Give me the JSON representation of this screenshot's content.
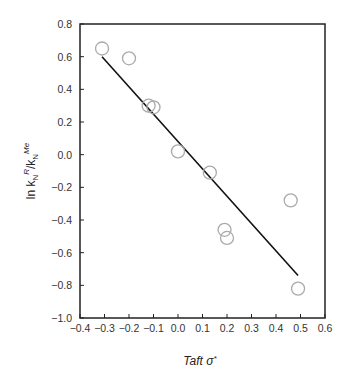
{
  "chart_data": {
    "type": "scatter",
    "title": "",
    "xlabel": "Taft σ*",
    "ylabel": "ln kN^R/kN^Me",
    "xlim": [
      -0.4,
      0.6
    ],
    "ylim": [
      -1.0,
      0.8
    ],
    "grid": false,
    "legend": null,
    "x_ticks": [
      -0.4,
      -0.3,
      -0.2,
      -0.1,
      0.0,
      0.1,
      0.2,
      0.3,
      0.4,
      0.5,
      0.6
    ],
    "x_tick_labels": [
      "−0.4",
      "−0.3",
      "−0.2",
      "−0.1",
      "0.0",
      "0.1",
      "0.2",
      "0.3",
      "0.4",
      "0.5",
      "0.6"
    ],
    "y_ticks": [
      -1.0,
      -0.8,
      -0.6,
      -0.4,
      -0.2,
      0.0,
      0.2,
      0.4,
      0.6,
      0.8
    ],
    "y_tick_labels": [
      "−1.0",
      "−0.8",
      "−0.6",
      "−0.4",
      "−0.2",
      "0.0",
      "0.2",
      "0.4",
      "0.6",
      "0.8"
    ],
    "series": [
      {
        "name": "data",
        "marker": "open-circle",
        "color": "#aaaaaa",
        "points": [
          {
            "x": -0.31,
            "y": 0.65
          },
          {
            "x": -0.2,
            "y": 0.59
          },
          {
            "x": -0.12,
            "y": 0.3
          },
          {
            "x": -0.1,
            "y": 0.29
          },
          {
            "x": 0.0,
            "y": 0.02
          },
          {
            "x": 0.13,
            "y": -0.11
          },
          {
            "x": 0.19,
            "y": -0.46
          },
          {
            "x": 0.2,
            "y": -0.51
          },
          {
            "x": 0.46,
            "y": -0.28
          },
          {
            "x": 0.49,
            "y": -0.82
          }
        ]
      },
      {
        "name": "linear fit",
        "type": "line",
        "color": "#111111",
        "points": [
          {
            "x": -0.31,
            "y": 0.6
          },
          {
            "x": 0.49,
            "y": -0.74
          }
        ]
      }
    ]
  },
  "labels": {
    "xlabel_main": "Taft σ",
    "xlabel_sup": "*",
    "ylabel_ln": "ln k",
    "ylabel_sub1": "N",
    "ylabel_sup1": "R",
    "ylabel_slash": "/k",
    "ylabel_sub2": "N",
    "ylabel_sup2": "Me"
  }
}
